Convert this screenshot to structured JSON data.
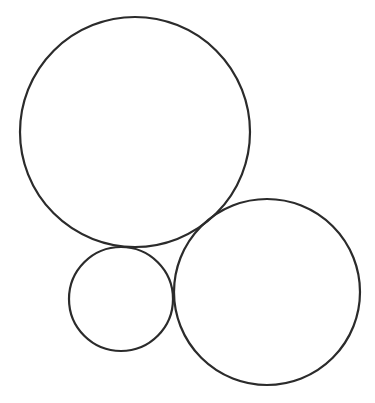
{
  "canvas": {
    "width": 375,
    "height": 403,
    "background": "#ffffff"
  },
  "style": {
    "stroke": "#2b2b2b",
    "stroke_width": 2.2,
    "fill": "none"
  },
  "circles": [
    {
      "name": "large-circle",
      "cx": 135,
      "cy": 132,
      "r": 115
    },
    {
      "name": "small-circle",
      "cx": 121,
      "cy": 299,
      "r": 52
    },
    {
      "name": "medium-circle",
      "cx": 267,
      "cy": 292,
      "r": 93
    }
  ]
}
